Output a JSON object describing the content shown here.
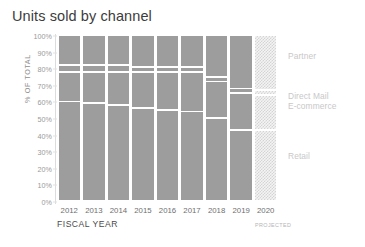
{
  "chart_data": {
    "type": "bar",
    "title": "Units sold by channel",
    "subtitle": "",
    "xlabel": "FISCAL YEAR",
    "ylabel": "% OF TOTAL",
    "ylim": [
      0,
      100
    ],
    "grid": false,
    "legend_position": "right",
    "stacked": true,
    "normalized_percent": true,
    "categories": [
      "2012",
      "2013",
      "2014",
      "2015",
      "2016",
      "2017",
      "2018",
      "2019",
      "2020"
    ],
    "ytick_labels": [
      "0%",
      "10%",
      "20%",
      "30%",
      "40%",
      "50%",
      "60%",
      "70%",
      "80%",
      "90%",
      "100%"
    ],
    "ytick_values": [
      0,
      10,
      20,
      30,
      40,
      50,
      60,
      70,
      80,
      90,
      100
    ],
    "annotations": [
      {
        "text": "PROJECTED",
        "category": "2020"
      }
    ],
    "series": [
      {
        "name": "Partner",
        "values": [
          18,
          18,
          18,
          19,
          19,
          19,
          25,
          32,
          33
        ]
      },
      {
        "name": "Direct Mail",
        "values": [
          4,
          4,
          4,
          3,
          3,
          3,
          3,
          3,
          3
        ]
      },
      {
        "name": "E-commerce",
        "values": [
          18,
          19,
          20,
          22,
          23,
          24,
          22,
          22,
          21
        ]
      },
      {
        "name": "Retail",
        "values": [
          60,
          59,
          58,
          56,
          55,
          54,
          50,
          43,
          43
        ]
      }
    ],
    "series_styles": [
      {
        "name": "Partner",
        "color": "#9d9d9d"
      },
      {
        "name": "Direct Mail",
        "color": "#9d9d9d"
      },
      {
        "name": "E-commerce",
        "color": "#9d9d9d"
      },
      {
        "name": "Retail",
        "color": "#9d9d9d"
      }
    ],
    "projected_categories": [
      "2020"
    ],
    "projected_fill": "hatch",
    "colors": {
      "bar_fill": "#9d9d9d",
      "projected_hatch": "#d4d4d4",
      "divider": "#ffffff",
      "title_text": "#3c3c3c",
      "axis_text": "#9a9a9a",
      "legend_text": "#c8c8c8"
    }
  },
  "legend": {
    "entries": [
      {
        "label": "Partner",
        "y_percent": 88
      },
      {
        "label": "Direct Mail",
        "y_percent": 64
      },
      {
        "label": "E-commerce",
        "y_percent": 58
      },
      {
        "label": "Retail",
        "y_percent": 28
      }
    ]
  }
}
